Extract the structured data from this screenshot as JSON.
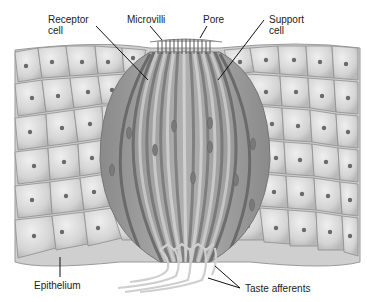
{
  "figure": {
    "colors": {
      "background": "#ffffff",
      "cell_fill": "#d6d6d6",
      "cell_highlight": "#ececec",
      "cell_border": "#8a8a8a",
      "nucleus": "#6a6a6a",
      "bud_fill": "#9a9a9a",
      "bud_stripe_dark": "#6e6e6e",
      "bud_stripe_light": "#c4c4c4",
      "afferent": "#dcdcdc",
      "leader_line": "#111111",
      "label_text": "#222222"
    }
  },
  "labels": {
    "receptor_cell": "Receptor\ncell",
    "microvilli": "Microvilli",
    "pore": "Pore",
    "support_cell": "Support\ncell",
    "epithelium": "Epithelium",
    "taste_afferents": "Taste afferents"
  }
}
